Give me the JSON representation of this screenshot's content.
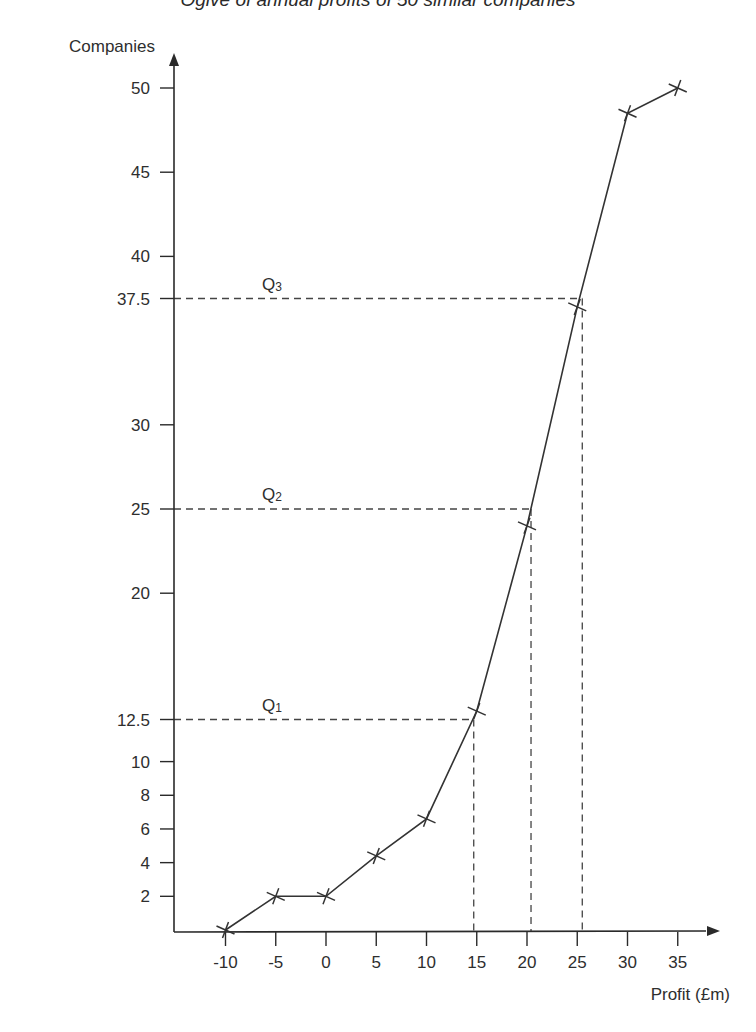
{
  "chart_data": {
    "type": "line",
    "title": "Ogive of annual profits of 50 similar companies",
    "xlabel": "Profit (£m)",
    "ylabel": "Companies",
    "x": [
      -10,
      -5,
      0,
      5,
      10,
      15,
      20,
      25,
      30,
      35
    ],
    "series": [
      {
        "name": "Cumulative frequency",
        "values": [
          0,
          2,
          2,
          4.4,
          6.6,
          13,
          24,
          37,
          48.5,
          50
        ],
        "marker": "x"
      }
    ],
    "x_ticks": [
      -10,
      -5,
      0,
      5,
      10,
      15,
      20,
      25,
      30,
      35
    ],
    "y_ticks": [
      2,
      4,
      6,
      8,
      10,
      12.5,
      20,
      25,
      30,
      37.5,
      40,
      45,
      50
    ],
    "xlim": [
      -15,
      40
    ],
    "ylim": [
      0,
      52
    ],
    "grid": false,
    "legend": null,
    "annotations": [
      {
        "label": "Q1",
        "main": "Q",
        "sub": "1",
        "y": 12.5,
        "x": 14.7
      },
      {
        "label": "Q2",
        "main": "Q",
        "sub": "2",
        "y": 25,
        "x": 20.4
      },
      {
        "label": "Q3",
        "main": "Q",
        "sub": "3",
        "y": 37.5,
        "x": 25.5
      }
    ],
    "colors": {
      "line": "#333333",
      "axis": "#2a2a2a",
      "dashed": "#444444"
    }
  }
}
